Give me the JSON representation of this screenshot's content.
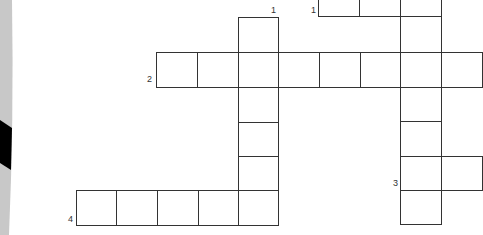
{
  "puzzle": {
    "type": "crossword",
    "clue_numbers": [
      {
        "label": "1",
        "x": 271,
        "y": 6,
        "ref": "down-1"
      },
      {
        "label": "1",
        "x": 311,
        "y": 6,
        "ref": "across-1"
      },
      {
        "label": "2",
        "x": 147,
        "y": 75,
        "ref": "across-2"
      },
      {
        "label": "3",
        "x": 393,
        "y": 179,
        "ref": "down-3"
      },
      {
        "label": "4",
        "x": 68,
        "y": 215,
        "ref": "across-4"
      }
    ],
    "words": {
      "across_1": {
        "cells": 3,
        "visible": "partial (cut at top)"
      },
      "across_2": {
        "cells": 8,
        "visible": "partial (continues off right edge)"
      },
      "down_1": {
        "cells": 6
      },
      "down_3": {
        "cells": 6
      },
      "across_4": {
        "cells": 5
      }
    }
  },
  "colors": {
    "grid_line": "#333333",
    "cell_fill": "#ffffff",
    "edge_gray": "#c8c8c8",
    "edge_black": "#000000"
  }
}
